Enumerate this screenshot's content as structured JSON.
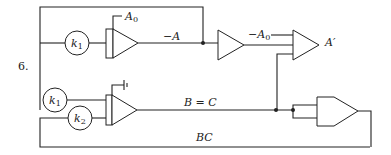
{
  "figure": {
    "number": "6.",
    "labels": {
      "k1_top": "k",
      "k1_top_sub": "1",
      "k1_bottom": "k",
      "k1_bottom_sub": "1",
      "k2": "k",
      "k2_sub": "2",
      "a0_input": "A",
      "a0_input_sub": "0",
      "neg_a": "−A",
      "neg_a0": "−A",
      "neg_a0_sub": "0",
      "a_prime": "A′",
      "b_eq_c": "B = C",
      "bc": "BC"
    }
  }
}
